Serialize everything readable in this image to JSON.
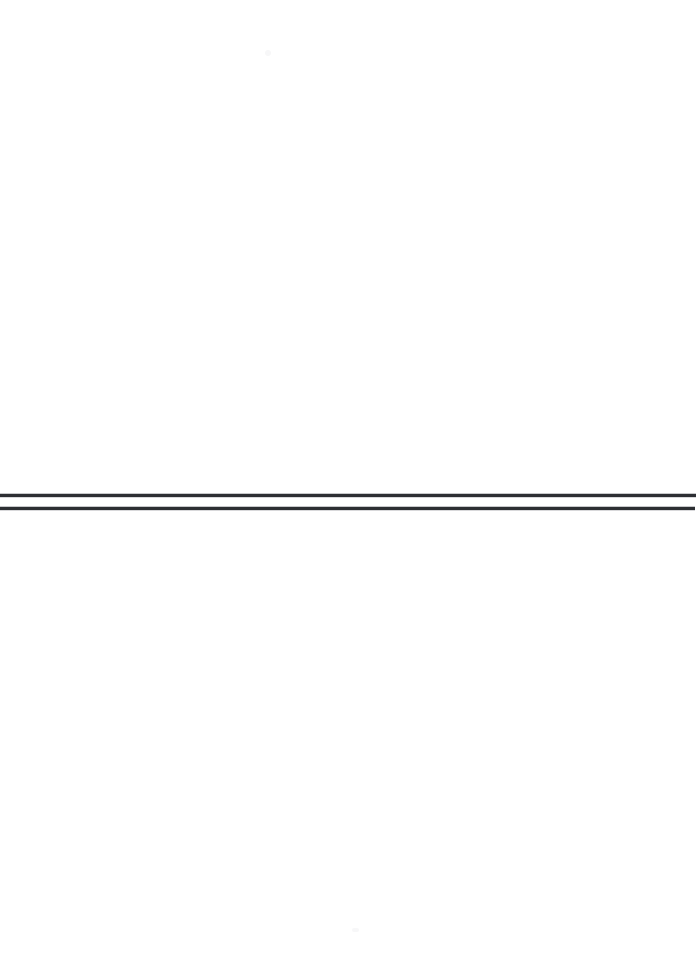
{
  "page": {
    "label": "scanned-blank-page",
    "width_px": 699,
    "height_px": 960,
    "background_color": "#ffffff",
    "visible_text": ""
  },
  "marks": {
    "rule_color": "#2d2f33",
    "rule_edge_color": "#5a5d63",
    "rules": [
      {
        "name": "upper-horizontal-rule",
        "x_start_px": 0,
        "x_end_px": 696,
        "y_px": 494,
        "thickness_px": 3
      },
      {
        "name": "lower-horizontal-rule",
        "x_start_px": 0,
        "x_end_px": 695,
        "y_px": 507,
        "thickness_px": 3
      }
    ],
    "specks": [
      {
        "name": "upper-scan-speck",
        "x_px": 268,
        "y_px": 53,
        "color": "#f7f7f8"
      },
      {
        "name": "lower-scan-speck",
        "x_px": 355,
        "y_px": 930,
        "color": "#f7f7f8"
      }
    ]
  }
}
